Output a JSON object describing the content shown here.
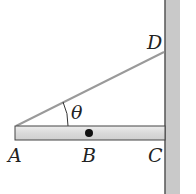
{
  "diagram": {
    "labels": {
      "A": "A",
      "B": "B",
      "C": "C",
      "D": "D",
      "theta": "θ"
    },
    "colors": {
      "wall": "#c8c8c8",
      "wall_edge": "#555555",
      "beam": "#dcdcdc",
      "beam_edge": "#444444",
      "cable": "#9a9a9a",
      "point": "#111111"
    }
  }
}
